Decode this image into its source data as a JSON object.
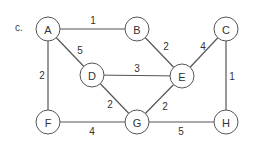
{
  "figure_label": "c.",
  "colors": {
    "stroke": "#555555",
    "text": "#333333",
    "background": "#ffffff"
  },
  "node_radius": 12,
  "nodes": [
    {
      "id": "A",
      "label": "A",
      "x": 48,
      "y": 29
    },
    {
      "id": "B",
      "label": "B",
      "x": 137,
      "y": 29
    },
    {
      "id": "C",
      "label": "C",
      "x": 226,
      "y": 29
    },
    {
      "id": "D",
      "label": "D",
      "x": 92,
      "y": 75
    },
    {
      "id": "E",
      "label": "E",
      "x": 182,
      "y": 76
    },
    {
      "id": "F",
      "label": "F",
      "x": 48,
      "y": 122
    },
    {
      "id": "G",
      "label": "G",
      "x": 137,
      "y": 122
    },
    {
      "id": "H",
      "label": "H",
      "x": 226,
      "y": 122
    }
  ],
  "edges": [
    {
      "from": "A",
      "to": "B",
      "weight": "1",
      "lx": 93,
      "ly": 20
    },
    {
      "from": "A",
      "to": "D",
      "weight": "5",
      "lx": 80,
      "ly": 50
    },
    {
      "from": "A",
      "to": "F",
      "weight": "2",
      "lx": 42,
      "ly": 75
    },
    {
      "from": "B",
      "to": "E",
      "weight": "2",
      "lx": 166,
      "ly": 46
    },
    {
      "from": "C",
      "to": "E",
      "weight": "4",
      "lx": 203,
      "ly": 46
    },
    {
      "from": "C",
      "to": "H",
      "weight": "1",
      "lx": 232,
      "ly": 76
    },
    {
      "from": "D",
      "to": "E",
      "weight": "3",
      "lx": 137,
      "ly": 68
    },
    {
      "from": "D",
      "to": "G",
      "weight": "2",
      "lx": 110,
      "ly": 104
    },
    {
      "from": "E",
      "to": "G",
      "weight": "2",
      "lx": 165,
      "ly": 106
    },
    {
      "from": "F",
      "to": "G",
      "weight": "4",
      "lx": 92,
      "ly": 131
    },
    {
      "from": "G",
      "to": "H",
      "weight": "5",
      "lx": 181,
      "ly": 131
    }
  ]
}
